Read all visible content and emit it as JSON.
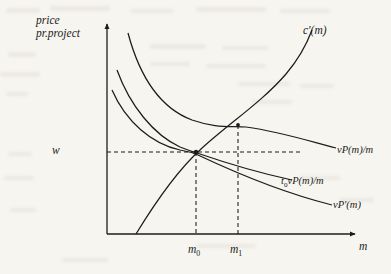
{
  "figure": {
    "type": "economics-diagram",
    "background_color": "#f7f5f0",
    "ink_color": "#1c1c1c",
    "axes": {
      "y_axis_label": "price\npr.project",
      "y_axis_label_line1": "price",
      "y_axis_label_line2": "pr.project",
      "x_axis_label": "m",
      "origin": {
        "x": 107,
        "y": 234
      },
      "y_top": {
        "x": 107,
        "y": 22
      },
      "x_right": {
        "x": 357,
        "y": 234
      }
    },
    "value_labels": {
      "wage": "w",
      "m_zero": "m",
      "m_zero_sub": "0",
      "m_one": "m",
      "m_one_sub": "1"
    },
    "curves": [
      {
        "name": "marginal-cost-curve",
        "label": "c'(m)",
        "label_text": "c'(m)",
        "shape": "increasing-convex",
        "points": [
          [
            138,
            232
          ],
          [
            160,
            196
          ],
          [
            180,
            170
          ],
          [
            196,
            152
          ],
          [
            215,
            136
          ],
          [
            238,
            125
          ],
          [
            262,
            108
          ],
          [
            282,
            85
          ],
          [
            298,
            60
          ],
          [
            310,
            33
          ]
        ]
      },
      {
        "name": "average-value-product-curve",
        "label": "vP(m)/m",
        "label_text": "vP(m)/m",
        "shape": "decreasing-convex",
        "points": [
          [
            128,
            33
          ],
          [
            140,
            62
          ],
          [
            152,
            85
          ],
          [
            168,
            105
          ],
          [
            186,
            118
          ],
          [
            210,
            126
          ],
          [
            238,
            125
          ],
          [
            270,
            133
          ],
          [
            300,
            140
          ],
          [
            335,
            148
          ]
        ]
      },
      {
        "name": "taxed-average-value-product-curve",
        "label": "t0vP(m)/m",
        "label_text": "t",
        "label_sub": "0",
        "label_rest": "vP(m)/m",
        "shape": "decreasing-convex",
        "points": [
          [
            117,
            70
          ],
          [
            128,
            92
          ],
          [
            142,
            112
          ],
          [
            158,
            130
          ],
          [
            175,
            144
          ],
          [
            196,
            152
          ],
          [
            225,
            163
          ],
          [
            258,
            172
          ],
          [
            290,
            180
          ]
        ]
      },
      {
        "name": "marginal-value-product-curve",
        "label": "vP'(m)",
        "label_text": "vP'(m)",
        "shape": "decreasing-convex",
        "points": [
          [
            112,
            90
          ],
          [
            124,
            111
          ],
          [
            138,
            128
          ],
          [
            156,
            142
          ],
          [
            175,
            149
          ],
          [
            196,
            152
          ],
          [
            228,
            170
          ],
          [
            262,
            186
          ],
          [
            295,
            198
          ],
          [
            330,
            206
          ]
        ]
      }
    ],
    "intersections": [
      {
        "name": "equilibrium-m0",
        "x": 196,
        "y": 152
      },
      {
        "name": "equilibrium-m1",
        "x": 238,
        "y": 125
      }
    ],
    "guide_lines": [
      {
        "name": "wage-horizontal-dashed",
        "from": [
          107,
          152
        ],
        "to": [
          300,
          152
        ]
      },
      {
        "name": "m0-vertical-dashed",
        "from": [
          196,
          152
        ],
        "to": [
          196,
          234
        ]
      },
      {
        "name": "m1-vertical-dashed",
        "from": [
          238,
          125
        ],
        "to": [
          238,
          234
        ]
      }
    ]
  }
}
